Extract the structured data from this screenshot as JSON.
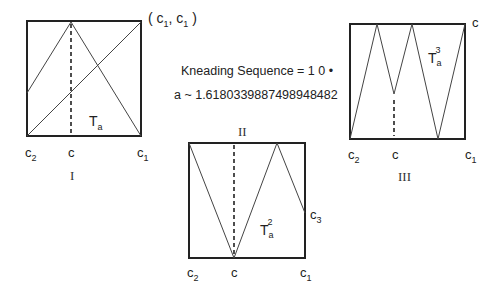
{
  "panels": [
    {
      "id": "I",
      "roman_label": "I",
      "map_label": {
        "base": "T",
        "sub": "a",
        "sup": ""
      },
      "axis_labels": {
        "left": {
          "base": "c",
          "sub": "2"
        },
        "mid": {
          "base": "c",
          "sub": ""
        },
        "right": {
          "base": "c",
          "sub": "1"
        }
      },
      "corner_label": "( c1 , c1 )",
      "corner_parts": {
        "open": "(",
        "a": "c",
        "a_sub": "1",
        "comma": ",",
        "b": "c",
        "b_sub": "1",
        "close": ")"
      }
    },
    {
      "id": "II",
      "roman_label": "II",
      "map_label": {
        "base": "T",
        "sub": "a",
        "sup": "2"
      },
      "axis_labels": {
        "left": {
          "base": "c",
          "sub": "2"
        },
        "mid": {
          "base": "c",
          "sub": ""
        },
        "right": {
          "base": "c",
          "sub": "1"
        }
      },
      "side_label": {
        "base": "c",
        "sub": "3"
      }
    },
    {
      "id": "III",
      "roman_label": "III",
      "map_label": {
        "base": "T",
        "sub": "a",
        "sup": "3"
      },
      "axis_labels": {
        "left": {
          "base": "c",
          "sub": "2"
        },
        "mid": {
          "base": "c",
          "sub": ""
        },
        "right": {
          "base": "c",
          "sub": "1"
        }
      },
      "corner_label": "c"
    }
  ],
  "info": {
    "kneading": "Kneading Sequence = 1 0 •",
    "parameter": "a ~ 1.6180339887498948482"
  }
}
